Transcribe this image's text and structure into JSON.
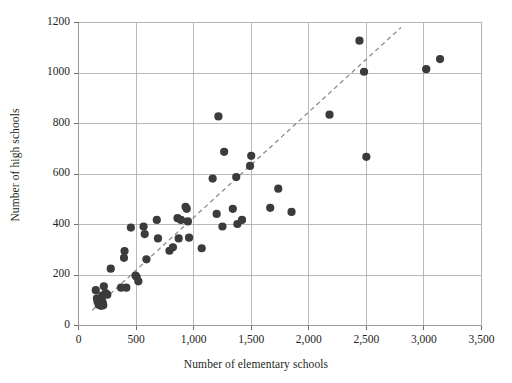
{
  "chart_data": {
    "type": "scatter",
    "title": "",
    "xlabel": "Number of elementary schools",
    "ylabel": "Number of high schools",
    "xlim": [
      0,
      3500
    ],
    "ylim": [
      0,
      1200
    ],
    "xticks": [
      0,
      500,
      1000,
      1500,
      2000,
      2500,
      3000,
      3500
    ],
    "xticklabels": [
      "0",
      "500",
      "1,000",
      "1,500",
      "2,000",
      "2,500",
      "3,000",
      "3,500"
    ],
    "yticks": [
      0,
      200,
      400,
      600,
      800,
      1000,
      1200
    ],
    "yticklabels": [
      "0",
      "200",
      "400",
      "600",
      "800",
      "1000",
      "1200"
    ],
    "grid": true,
    "legend": null,
    "marker_color": "#3b3b3b",
    "marker_size": 5,
    "gridline_color": "#b3b3b3",
    "trendline": {
      "style": "dashed",
      "color": "#8c8c8c",
      "x": [
        120,
        2800
      ],
      "y": [
        60,
        1180
      ]
    },
    "points": [
      {
        "x": 150,
        "y": 140
      },
      {
        "x": 160,
        "y": 108
      },
      {
        "x": 165,
        "y": 95
      },
      {
        "x": 175,
        "y": 82
      },
      {
        "x": 185,
        "y": 90
      },
      {
        "x": 190,
        "y": 100
      },
      {
        "x": 195,
        "y": 78
      },
      {
        "x": 200,
        "y": 86
      },
      {
        "x": 205,
        "y": 118
      },
      {
        "x": 210,
        "y": 92
      },
      {
        "x": 215,
        "y": 80
      },
      {
        "x": 220,
        "y": 155
      },
      {
        "x": 235,
        "y": 128
      },
      {
        "x": 250,
        "y": 122
      },
      {
        "x": 280,
        "y": 225
      },
      {
        "x": 370,
        "y": 150
      },
      {
        "x": 395,
        "y": 268
      },
      {
        "x": 400,
        "y": 295
      },
      {
        "x": 415,
        "y": 150
      },
      {
        "x": 455,
        "y": 388
      },
      {
        "x": 495,
        "y": 198
      },
      {
        "x": 505,
        "y": 192
      },
      {
        "x": 520,
        "y": 175
      },
      {
        "x": 565,
        "y": 392
      },
      {
        "x": 575,
        "y": 362
      },
      {
        "x": 590,
        "y": 262
      },
      {
        "x": 680,
        "y": 418
      },
      {
        "x": 690,
        "y": 345
      },
      {
        "x": 790,
        "y": 296
      },
      {
        "x": 820,
        "y": 310
      },
      {
        "x": 860,
        "y": 425
      },
      {
        "x": 870,
        "y": 345
      },
      {
        "x": 890,
        "y": 418
      },
      {
        "x": 930,
        "y": 470
      },
      {
        "x": 940,
        "y": 462
      },
      {
        "x": 950,
        "y": 412
      },
      {
        "x": 960,
        "y": 348
      },
      {
        "x": 1070,
        "y": 306
      },
      {
        "x": 1165,
        "y": 582
      },
      {
        "x": 1200,
        "y": 442
      },
      {
        "x": 1215,
        "y": 828
      },
      {
        "x": 1250,
        "y": 392
      },
      {
        "x": 1265,
        "y": 688
      },
      {
        "x": 1340,
        "y": 462
      },
      {
        "x": 1370,
        "y": 588
      },
      {
        "x": 1380,
        "y": 402
      },
      {
        "x": 1420,
        "y": 418
      },
      {
        "x": 1490,
        "y": 632
      },
      {
        "x": 1500,
        "y": 672
      },
      {
        "x": 1665,
        "y": 466
      },
      {
        "x": 1735,
        "y": 542
      },
      {
        "x": 1850,
        "y": 450
      },
      {
        "x": 2180,
        "y": 835
      },
      {
        "x": 2440,
        "y": 1128
      },
      {
        "x": 2480,
        "y": 1005
      },
      {
        "x": 2500,
        "y": 668
      },
      {
        "x": 3020,
        "y": 1015
      },
      {
        "x": 3140,
        "y": 1055
      }
    ]
  }
}
